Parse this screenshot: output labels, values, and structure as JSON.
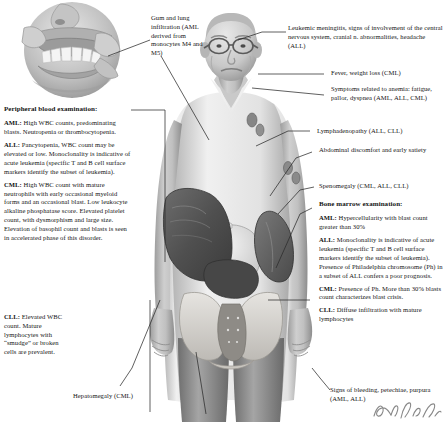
{
  "figure_title": "Clinical and laboratory manifestations of leukemia",
  "background_color": "#ffffff",
  "text_color": "#141414",
  "callouts": {
    "gum_lung": {
      "text": "Gum and lung infiltration (AML derived from monocytes M4 and M5)"
    },
    "meningitis": {
      "text": "Leukemic meningitis, signs of involvement of the central nervous system, cranial n. abnormalities, headache (ALL)"
    },
    "fever": {
      "text": "Fever, weight loss (CML)"
    },
    "anemia": {
      "text": "Symptoms related to anemia: fatigue, pallor, dyspnea (AML, ALL, CML)"
    },
    "lymphadenopathy": {
      "text": "Lymphadenopathy (ALL, CLL)"
    },
    "abdominal": {
      "text": "Abdominal discomfort and early satiety"
    },
    "splenomegaly": {
      "text": "Spenomegaly (CML, ALL, CLL)"
    },
    "hepatomegaly": {
      "text": "Hepatomegaly (CML)"
    },
    "bleeding": {
      "text": "Signs of bleeding, petechiae, purpura (AML, ALL)"
    }
  },
  "peripheral_blood": {
    "heading": "Peripheral blood examination:",
    "entries": [
      {
        "label": "AML:",
        "text": " High WBC counts, predominating blasts. Neutropenia or thrombocytopenia."
      },
      {
        "label": "ALL:",
        "text": " Pancytopenia, WBC count may be elevated or low. Monoclonality is indicative of acute leukemia (specific T and B cell surface markers identify the subset of leukemia)."
      },
      {
        "label": "CML:",
        "text": " High WBC count with mature neutrophils with early occasional myeloid forms and an occasional blast. Low leukocyte alkaline phosphatase score. Elevated platelet count, with dysmorphism and large size. Elevation of basophil count and blasts is seen in accelerated phase of this disorder."
      },
      {
        "label": "CLL:",
        "text": " Elevated WBC count. Mature lymphocytes with “smudge” or broken cells are prevalent."
      }
    ]
  },
  "bone_marrow": {
    "heading": "Bone marrow examination:",
    "entries": [
      {
        "label": "AML:",
        "text": " Hypercellularity with blast count greater than 30%"
      },
      {
        "label": "ALL:",
        "text": " Monoclonality is indicative of acute leukemia (specific T and B cell surface markers identify the subset of leukemia). Presence of Philadelphia chromosome (Ph) in a subset of ALL confers a poor prognosis."
      },
      {
        "label": "CML:",
        "text": " Presence of Ph. More than 30% blasts count characterizes blast crisis."
      },
      {
        "label": "CLL:",
        "text": " Diffuse infiltration with mature lymphocytes"
      }
    ]
  },
  "artwork": {
    "inset_label": "mouth-gum-infiltration-illustration",
    "figure_label": "elderly-male-torso-anatomy-illustration",
    "organs": [
      "liver",
      "spleen",
      "stomach",
      "pelvis",
      "lymph-nodes"
    ],
    "signature_present": true
  }
}
